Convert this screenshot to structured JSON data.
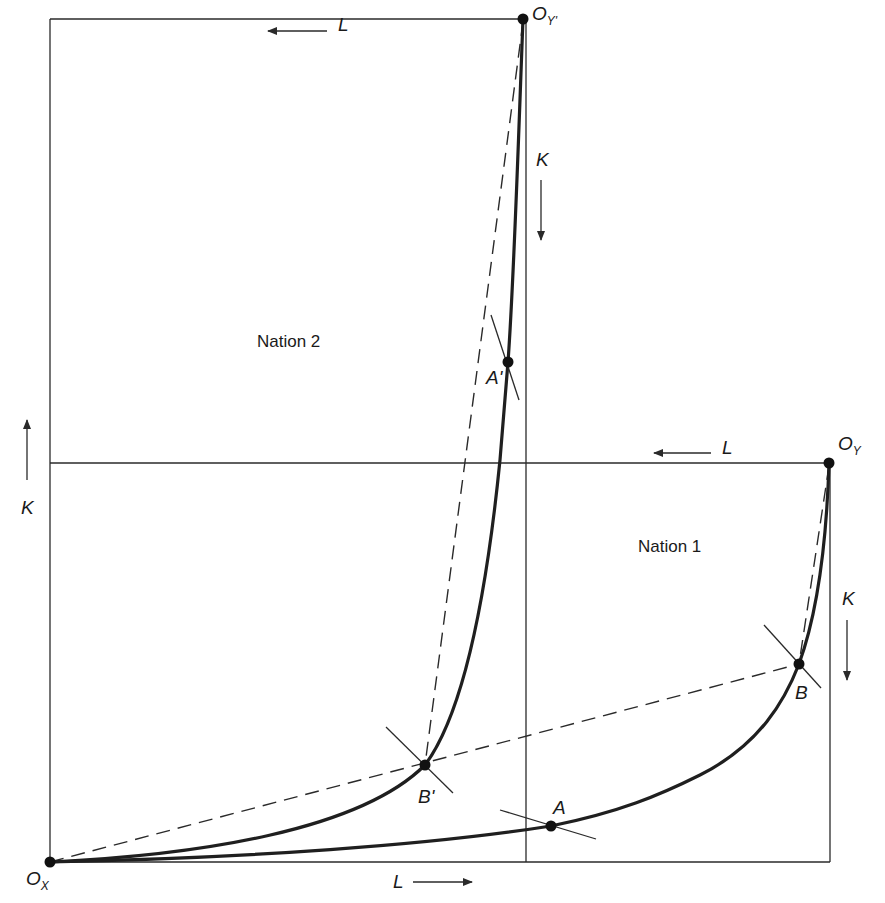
{
  "figure": {
    "type": "Edgeworth box diagram comparison",
    "nations": [
      {
        "name": "Nation 1",
        "origin_x_label": "O",
        "origin_x_sub": "X",
        "origin_y_label": "O",
        "origin_y_sub": "Y"
      },
      {
        "name": "Nation 2",
        "origin_x_label": "O",
        "origin_x_sub": "X",
        "origin_y_label": "O",
        "origin_y_sub": "Y'"
      }
    ]
  },
  "labels": {
    "nation1": "Nation 1",
    "nation2": "Nation 2",
    "origin_x": {
      "main": "O",
      "sub": "X"
    },
    "origin_y": {
      "main": "O",
      "sub": "Y"
    },
    "origin_y_prime": {
      "main": "O",
      "sub": "Y'"
    },
    "axis_L_top": "L",
    "axis_L_mid": "L",
    "axis_L_bottom": "L",
    "axis_K_left": "K",
    "axis_K_upper_right": "K",
    "axis_K_lower_right": "K",
    "point_A": "A",
    "point_A_prime": "A'",
    "point_B": "B",
    "point_B_prime": "B'"
  },
  "colors": {
    "line": "#2a2a2a",
    "curve": "#1f1f1f",
    "background": "#ffffff"
  }
}
